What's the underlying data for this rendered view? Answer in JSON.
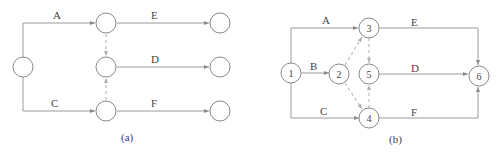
{
  "diagram_a": {
    "caption": "(a)",
    "edges": {
      "A": "A",
      "C": "C",
      "E": "E",
      "D": "D",
      "F": "F"
    }
  },
  "diagram_b": {
    "caption": "(b)",
    "nodes": {
      "n1": "1",
      "n2": "2",
      "n3": "3",
      "n4": "4",
      "n5": "5",
      "n6": "6"
    },
    "edges": {
      "A": "A",
      "B": "B",
      "C": "C",
      "E": "E",
      "D": "D",
      "F": "F"
    }
  },
  "colors": {
    "line": "#9a9a9a",
    "dummy": "#bdbdbd",
    "node_stroke": "#8a8a8a"
  }
}
